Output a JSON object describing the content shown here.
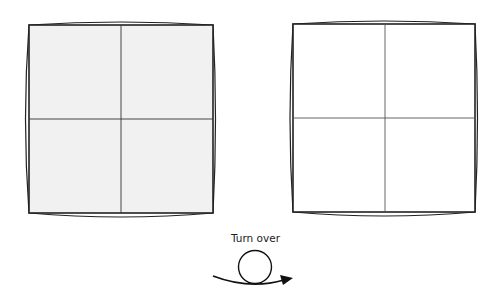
{
  "diagram": {
    "steps": [
      {
        "id": "front",
        "fill": "#f1f1f1",
        "stroke": "#222222",
        "square": {
          "x1": 29,
          "y1": 25,
          "x2": 213,
          "y2": 213
        },
        "creases": {
          "vx": 121,
          "hy": 119
        }
      },
      {
        "id": "back",
        "fill": "#ffffff",
        "stroke": "#222222",
        "square": {
          "x1": 293,
          "y1": 24,
          "x2": 475,
          "y2": 212
        },
        "creases": {
          "vx": 385,
          "hy": 118
        }
      }
    ],
    "instruction": {
      "label": "Turn over",
      "symbol": "turn-over-arrow"
    }
  }
}
